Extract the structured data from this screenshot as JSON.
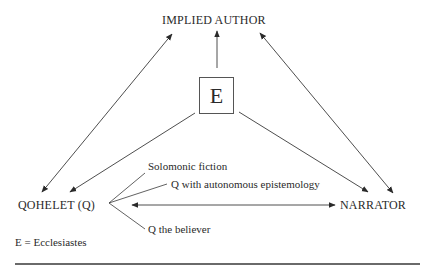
{
  "diagram": {
    "nodes": {
      "implied_author": "IMPLIED AUTHOR",
      "ecclesiastes": "E",
      "qohelet": "QOHELET (Q)",
      "narrator": "NARRATOR"
    },
    "qohelet_aspects": [
      "Solomonic fiction",
      "Q with autonomous epistemology",
      "Q the believer"
    ],
    "legend": "E = Ecclesiastes",
    "edges": [
      {
        "from": "QOHELET (Q)",
        "to": "IMPLIED AUTHOR",
        "type": "double-arrow"
      },
      {
        "from": "E",
        "to": "IMPLIED AUTHOR",
        "type": "arrow"
      },
      {
        "from": "NARRATOR",
        "to": "IMPLIED AUTHOR",
        "type": "double-arrow"
      },
      {
        "from": "E",
        "to": "QOHELET (Q)",
        "type": "arrow"
      },
      {
        "from": "E",
        "to": "NARRATOR",
        "type": "arrow"
      },
      {
        "from": "QOHELET (Q)",
        "to": "NARRATOR",
        "type": "double-arrow"
      }
    ],
    "colors": {
      "line": "#3a3a3a",
      "text": "#2a2a2a",
      "rule": "#6a6a6a"
    }
  }
}
